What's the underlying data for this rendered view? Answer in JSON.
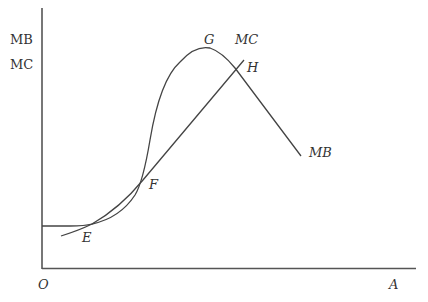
{
  "axes": {
    "y_label_line1": "MB",
    "y_label_line2": "MC",
    "origin_label": "O",
    "x_label": "A"
  },
  "curves": {
    "mb_label": "MB",
    "mc_label": "MC"
  },
  "points": {
    "e": "E",
    "f": "F",
    "g": "G",
    "h": "H"
  },
  "colors": {
    "line": "#444444",
    "axis": "#555555"
  }
}
